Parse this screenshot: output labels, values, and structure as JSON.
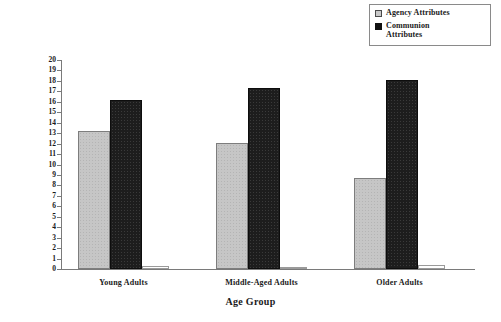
{
  "chart_data": {
    "type": "bar",
    "title": "",
    "subtitle": "",
    "xlabel": "Age Group",
    "ylabel": "Mean Number",
    "ylim": [
      0,
      20
    ],
    "ytick_step": 1,
    "grid": false,
    "legend_position": "top-right",
    "categories": [
      "Young Adults",
      "Middle-Aged Adults",
      "Older Adults"
    ],
    "ytick_labels": [
      "20",
      "19",
      "18",
      "17",
      "16",
      "15",
      "14",
      "13",
      "12",
      "11",
      "10",
      "9",
      "8",
      "7",
      "6",
      "5",
      "4",
      "3",
      "2",
      "1",
      "0"
    ],
    "series": [
      {
        "name": "Agency Attributes",
        "color": "#c6c6c6",
        "values": [
          13.2,
          12.1,
          8.7
        ]
      },
      {
        "name": "Communion Attributes",
        "color": "#1d1d1d",
        "values": [
          16.2,
          17.3,
          18.1
        ]
      },
      {
        "name": "",
        "color": "#ffffff",
        "values": [
          0.3,
          0.2,
          0.35
        ]
      }
    ]
  },
  "legend": {
    "items": [
      {
        "label": "Agency Attributes",
        "swatch": "agency-swatch"
      },
      {
        "label": "Communion\nAttributes",
        "swatch": "communion-swatch"
      }
    ]
  },
  "axes": {
    "y_title": "Mean Number",
    "x_title": "Age Group"
  }
}
